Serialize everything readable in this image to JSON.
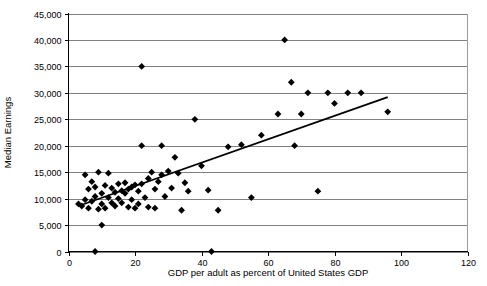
{
  "chart_data": {
    "type": "scatter",
    "title": "",
    "xlabel": "GDP per adult as percent of United States GDP",
    "ylabel": "Median Earnings",
    "xlim": [
      0,
      120
    ],
    "ylim": [
      0,
      45000
    ],
    "xticks": [
      0,
      20,
      40,
      60,
      80,
      100,
      120
    ],
    "xtick_labels": [
      "0",
      "20",
      "40",
      "60",
      "80",
      "100",
      "120"
    ],
    "yticks": [
      0,
      5000,
      10000,
      15000,
      20000,
      25000,
      30000,
      35000,
      40000,
      45000
    ],
    "ytick_labels": [
      "0",
      "5,000",
      "10,000",
      "15,000",
      "20,000",
      "25,000",
      "30,000",
      "35,000",
      "40,000",
      "45,000"
    ],
    "grid": "horizontal",
    "legend": "none",
    "marker": "diamond",
    "marker_color": "#000000",
    "points": [
      [
        3,
        9000
      ],
      [
        4,
        8600
      ],
      [
        5,
        9800
      ],
      [
        5,
        14500
      ],
      [
        6,
        11800
      ],
      [
        6,
        8200
      ],
      [
        7,
        9500
      ],
      [
        7,
        13200
      ],
      [
        8,
        12200
      ],
      [
        8,
        10400
      ],
      [
        8,
        0
      ],
      [
        9,
        8000
      ],
      [
        9,
        15000
      ],
      [
        10,
        11000
      ],
      [
        10,
        9000
      ],
      [
        10,
        5000
      ],
      [
        11,
        12500
      ],
      [
        11,
        8200
      ],
      [
        12,
        14800
      ],
      [
        12,
        10200
      ],
      [
        13,
        9200
      ],
      [
        13,
        12000
      ],
      [
        14,
        11200
      ],
      [
        14,
        8600
      ],
      [
        15,
        12800
      ],
      [
        15,
        10000
      ],
      [
        16,
        11500
      ],
      [
        16,
        9200
      ],
      [
        17,
        13000
      ],
      [
        17,
        11000
      ],
      [
        18,
        8400
      ],
      [
        18,
        11800
      ],
      [
        19,
        12200
      ],
      [
        19,
        9800
      ],
      [
        20,
        12600
      ],
      [
        20,
        8200
      ],
      [
        21,
        11400
      ],
      [
        21,
        9000
      ],
      [
        22,
        35000
      ],
      [
        22,
        20000
      ],
      [
        22,
        12800
      ],
      [
        23,
        10200
      ],
      [
        24,
        13800
      ],
      [
        24,
        8400
      ],
      [
        25,
        15000
      ],
      [
        26,
        11800
      ],
      [
        26,
        8200
      ],
      [
        27,
        13200
      ],
      [
        28,
        20000
      ],
      [
        28,
        14500
      ],
      [
        29,
        10400
      ],
      [
        30,
        15200
      ],
      [
        31,
        12000
      ],
      [
        32,
        17800
      ],
      [
        33,
        14800
      ],
      [
        34,
        7800
      ],
      [
        35,
        13000
      ],
      [
        36,
        11400
      ],
      [
        38,
        25000
      ],
      [
        40,
        16200
      ],
      [
        42,
        11600
      ],
      [
        43,
        0
      ],
      [
        45,
        7800
      ],
      [
        48,
        19800
      ],
      [
        52,
        20200
      ],
      [
        55,
        10200
      ],
      [
        58,
        22000
      ],
      [
        63,
        26000
      ],
      [
        65,
        40000
      ],
      [
        67,
        32000
      ],
      [
        68,
        20000
      ],
      [
        70,
        26000
      ],
      [
        72,
        30000
      ],
      [
        75,
        11400
      ],
      [
        78,
        30000
      ],
      [
        80,
        28000
      ],
      [
        84,
        30000
      ],
      [
        88,
        30000
      ],
      [
        96,
        26400
      ]
    ],
    "trend_line": {
      "x_start": 3,
      "y_start": 8600,
      "x_end": 96,
      "y_end": 29200
    }
  }
}
